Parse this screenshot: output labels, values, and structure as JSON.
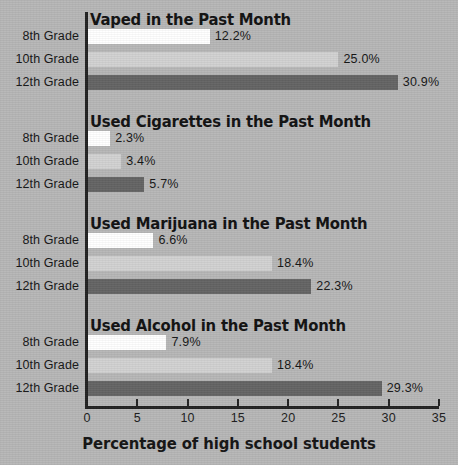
{
  "chart_data": {
    "type": "bar",
    "orientation": "horizontal",
    "title": "",
    "xlabel": "Percentage of high school students",
    "ylabel": "",
    "xlim": [
      0,
      35
    ],
    "xticks": [
      0,
      5,
      10,
      15,
      20,
      25,
      30,
      35
    ],
    "xtick_labels": [
      "0",
      "5",
      "10",
      "15",
      "20",
      "25",
      "30",
      "35"
    ],
    "grid": false,
    "legend": "none",
    "categories": [
      "8th Grade",
      "10th Grade",
      "12th Grade"
    ],
    "series_colors": {
      "8th Grade": "#ffffff",
      "10th Grade": "#d2d2d2",
      "12th Grade": "#646464"
    },
    "panels": [
      {
        "title": "Vaped in the Past Month",
        "bars": [
          {
            "category": "8th Grade",
            "value": 12.2,
            "label": "12.2%",
            "color": "#ffffff"
          },
          {
            "category": "10th Grade",
            "value": 25.0,
            "label": "25.0%",
            "color": "#d2d2d2"
          },
          {
            "category": "12th Grade",
            "value": 30.9,
            "label": "30.9%",
            "color": "#646464"
          }
        ]
      },
      {
        "title": "Used Cigarettes in the Past Month",
        "bars": [
          {
            "category": "8th Grade",
            "value": 2.3,
            "label": "2.3%",
            "color": "#ffffff"
          },
          {
            "category": "10th Grade",
            "value": 3.4,
            "label": "3.4%",
            "color": "#d2d2d2"
          },
          {
            "category": "12th Grade",
            "value": 5.7,
            "label": "5.7%",
            "color": "#646464"
          }
        ]
      },
      {
        "title": "Used Marijuana in the Past Month",
        "bars": [
          {
            "category": "8th Grade",
            "value": 6.6,
            "label": "6.6%",
            "color": "#ffffff"
          },
          {
            "category": "10th Grade",
            "value": 18.4,
            "label": "18.4%",
            "color": "#d2d2d2"
          },
          {
            "category": "12th Grade",
            "value": 22.3,
            "label": "22.3%",
            "color": "#646464"
          }
        ]
      },
      {
        "title": "Used Alcohol in the Past Month",
        "bars": [
          {
            "category": "8th Grade",
            "value": 7.9,
            "label": "7.9%",
            "color": "#ffffff"
          },
          {
            "category": "10th Grade",
            "value": 18.4,
            "label": "18.4%",
            "color": "#d2d2d2"
          },
          {
            "category": "12th Grade",
            "value": 29.3,
            "label": "29.3%",
            "color": "#646464"
          }
        ]
      }
    ]
  },
  "figure": {
    "background_color": "#b7b7b7",
    "axis_color": "#222222",
    "text_color": "#151515"
  }
}
